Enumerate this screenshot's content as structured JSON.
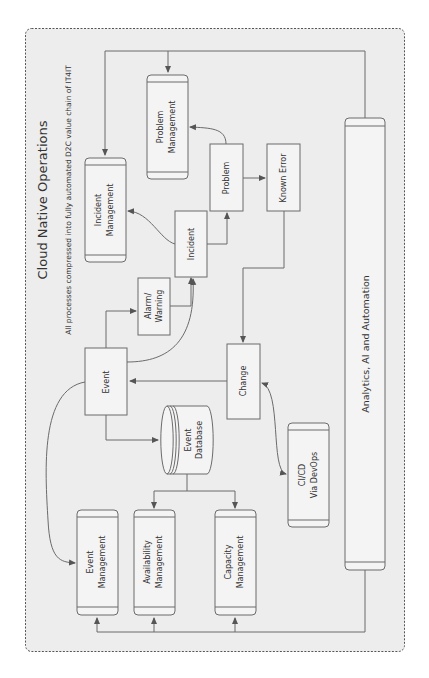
{
  "diagram": {
    "title": "Cloud Native Operations",
    "subtitle": "All processes compressed into fully automated D2C value chain of IT4IT",
    "orientation": "rotated 90° counter-clockwise",
    "colors": {
      "background": "#ededed",
      "border": "#6b6b6b",
      "box_fill": "#f4f4f4",
      "text": "#333333"
    },
    "nodes": {
      "incident_management": {
        "line1": "Incident",
        "line2": "Management"
      },
      "problem_management": {
        "line1": "Problem",
        "line2": "Management"
      },
      "alarm_warning": {
        "line1": "Alarm/",
        "line2": "Warning"
      },
      "incident": {
        "label": "Incident"
      },
      "problem": {
        "label": "Problem"
      },
      "known_error": {
        "label": "Known Error"
      },
      "analytics": {
        "label": "Analytics, AI and Automation"
      },
      "event": {
        "label": "Event"
      },
      "event_database": {
        "line1": "Event",
        "line2": "Database"
      },
      "change": {
        "label": "Change"
      },
      "cicd": {
        "line1": "CI/CD",
        "line2": "Via DevOps"
      },
      "event_management": {
        "line1": "Event",
        "line2": "Management"
      },
      "availability_management": {
        "line1": "Availability",
        "line2": "Management"
      },
      "capacity_management": {
        "line1": "Capacity",
        "line2": "Management"
      }
    },
    "edges": [
      [
        "Event",
        "Alarm/Warning"
      ],
      [
        "Event",
        "Incident"
      ],
      [
        "Event",
        "Event Database"
      ],
      [
        "Event",
        "Event Management"
      ],
      [
        "Alarm/Warning",
        "Incident"
      ],
      [
        "Incident",
        "Incident Management"
      ],
      [
        "Incident",
        "Problem"
      ],
      [
        "Problem",
        "Problem Management"
      ],
      [
        "Problem",
        "Known Error"
      ],
      [
        "Known Error",
        "Change"
      ],
      [
        "Change",
        "Event"
      ],
      [
        "Change",
        "CI/CD Via DevOps"
      ],
      [
        "CI/CD Via DevOps",
        "Change"
      ],
      [
        "Event Database",
        "Availability Management"
      ],
      [
        "Event Database",
        "Capacity Management"
      ],
      [
        "Analytics, AI and Automation",
        "Incident Management"
      ],
      [
        "Analytics, AI and Automation",
        "Problem Management"
      ],
      [
        "Analytics, AI and Automation",
        "Event Management"
      ],
      [
        "Analytics, AI and Automation",
        "Availability Management"
      ],
      [
        "Analytics, AI and Automation",
        "Capacity Management"
      ]
    ]
  }
}
